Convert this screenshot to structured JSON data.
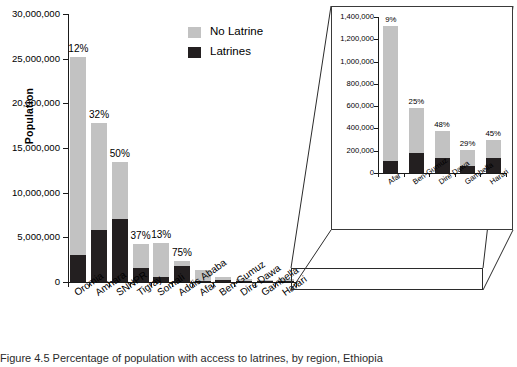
{
  "figure": {
    "caption": "Figure 4.5 Percentage of population with access to latrines, by region, Ethiopia"
  },
  "legend": {
    "position": "top-center",
    "items": [
      {
        "label": "No Latrine",
        "color": "#c2c2c2",
        "swatch_name": "no-latrine-swatch"
      },
      {
        "label": "Latrines",
        "color": "#231f20",
        "swatch_name": "latrines-swatch"
      }
    ]
  },
  "chart_data": {
    "type": "bar",
    "title": "",
    "subtype": "stacked",
    "xlabel": "",
    "ylabel": "Population",
    "ylim": [
      0,
      30000000
    ],
    "grid": false,
    "categories": [
      "Oromia",
      "Amhara",
      "SNNPR",
      "Tigray",
      "Somali",
      "Addis Ababa",
      "Afar",
      "Ben-Gumuz",
      "Dire Dawa",
      "Gambella",
      "Harari"
    ],
    "yticks": [
      0,
      5000000,
      10000000,
      15000000,
      20000000,
      25000000,
      30000000
    ],
    "ytick_labels": [
      "0",
      "5,000,000",
      "10,000,000",
      "15,000,000",
      "20,000,000",
      "25,000,000",
      "30,000,000"
    ],
    "series": [
      {
        "name": "Latrines",
        "color": "#231f20",
        "values": [
          3000000,
          5800000,
          7100000,
          1550000,
          560000,
          1750000,
          105000,
          180000,
          135000,
          60000,
          135000
        ]
      },
      {
        "name": "No Latrine",
        "color": "#c2c2c2",
        "values": [
          22200000,
          12000000,
          6300000,
          2650000,
          3750000,
          580000,
          1215000,
          400000,
          240000,
          145000,
          165000
        ]
      }
    ],
    "totals": [
      25200000,
      17800000,
      13400000,
      4200000,
      4310000,
      2330000,
      1320000,
      580000,
      375000,
      205000,
      300000
    ],
    "annotations": [
      "12%",
      "32%",
      "50%",
      "37%",
      "13%",
      "75%",
      "9%",
      "25%",
      "48%",
      "29%",
      "45%"
    ],
    "main_panel_categories": [
      "Oromia",
      "Amhara",
      "SNNPR",
      "Tigray",
      "Somali",
      "Addis Ababa",
      "Afar",
      "Ben-Gumuz",
      "Dire Dawa",
      "Gambella",
      "Harari"
    ],
    "main_panel_annotations": [
      "12%",
      "32%",
      "50%",
      "37%",
      "13%",
      "75%"
    ],
    "inset": {
      "type": "bar",
      "subtype": "stacked",
      "ylim": [
        0,
        1400000
      ],
      "yticks": [
        0,
        200000,
        400000,
        600000,
        800000,
        1000000,
        1200000,
        1400000
      ],
      "ytick_labels": [
        "0",
        "200,000",
        "400,000",
        "600,000",
        "800,000",
        "1,000,000",
        "1,200,000",
        "1,400,000"
      ],
      "categories": [
        "Afar",
        "Ben-Gumuz",
        "Dire Dawa",
        "Gambella",
        "Harari"
      ],
      "annotations": [
        "9%",
        "25%",
        "48%",
        "29%",
        "45%"
      ],
      "series": [
        {
          "name": "Latrines",
          "color": "#231f20",
          "values": [
            105000,
            180000,
            135000,
            60000,
            135000
          ]
        },
        {
          "name": "No Latrine",
          "color": "#c2c2c2",
          "values": [
            1215000,
            400000,
            240000,
            145000,
            165000
          ]
        }
      ],
      "totals": [
        1320000,
        580000,
        375000,
        205000,
        300000
      ]
    }
  }
}
